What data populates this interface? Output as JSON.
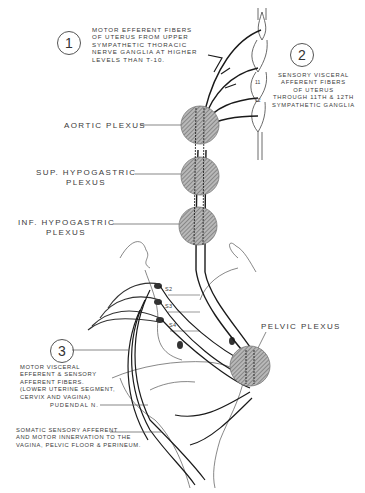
{
  "diagram": {
    "type": "anatomical nerve innervation diagram",
    "callouts": [
      {
        "number": "1",
        "text": "MOTOR EFFERENT FIBERS\nOF UTERUS FROM UPPER\nSYMPATHETIC THORACIC\nNERVE GANGLIA AT HIGHER\nLEVELS THAN T-10."
      },
      {
        "number": "2",
        "text": "SENSORY VISCERAL\nAFFERENT FIBERS\nOF UTERUS\nTHROUGH 11th & 12th\nSYMPATHETIC GANGLIA"
      },
      {
        "number": "3",
        "text": "MOTOR VISCERAL\nEFFERENT & SENSORY\nAFFERENT FIBERS.\n(LOWER UTERINE SEGMENT,\nCERVIX AND VAGINA)"
      }
    ],
    "plexus_labels": {
      "aortic": "AORTIC PLEXUS",
      "sup_hypogastric": "SUP. HYPOGASTRIC\nPLEXUS",
      "inf_hypogastric": "INF. HYPOGASTRIC\nPLEXUS",
      "pelvic": "PELVIC PLEXUS"
    },
    "sacral_labels": [
      "S2",
      "S3",
      "S4"
    ],
    "vertebra_labels": [
      "11",
      "12"
    ],
    "pudendal_label": "PUDENDAL N.",
    "somatic_label": "SOMATIC SENSORY AFFERENT\nAND MOTOR INNERVATION TO THE\nVAGINA, PELVIC FLOOR & PERINEUM."
  },
  "colors": {
    "line": "#1a1a1a",
    "plexus_fill": "#9a9a9a",
    "text": "#3a3a3a"
  }
}
